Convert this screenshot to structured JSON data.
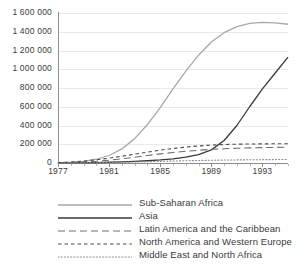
{
  "chart_data": {
    "type": "line",
    "title": "",
    "xlabel": "",
    "ylabel": "",
    "xlim": [
      1977,
      1995
    ],
    "ylim": [
      0,
      1600000
    ],
    "grid": true,
    "legend_position": "bottom",
    "x_ticks": [
      "1977",
      "1981",
      "1985",
      "1989",
      "1993"
    ],
    "x_tick_values": [
      1977,
      1981,
      1985,
      1989,
      1993
    ],
    "y_ticks": [
      "0",
      "200 000",
      "400 000",
      "600 000",
      "800 000",
      "1 000 000",
      "1 200 000",
      "1 400 000",
      "1 600 000"
    ],
    "y_tick_values": [
      0,
      200000,
      400000,
      600000,
      800000,
      1000000,
      1200000,
      1400000,
      1600000
    ],
    "x": [
      1977,
      1978,
      1979,
      1980,
      1981,
      1982,
      1983,
      1984,
      1985,
      1986,
      1987,
      1988,
      1989,
      1990,
      1991,
      1992,
      1993,
      1994,
      1995
    ],
    "series": [
      {
        "name": "Sub-Saharan Africa",
        "style": "solid",
        "color": "#a8a8a8",
        "values": [
          3000,
          8000,
          18000,
          40000,
          80000,
          150000,
          260000,
          410000,
          590000,
          790000,
          980000,
          1150000,
          1290000,
          1390000,
          1455000,
          1490000,
          1500000,
          1495000,
          1480000
        ]
      },
      {
        "name": "Asia",
        "style": "solid",
        "color": "#3a3a3a",
        "values": [
          1000,
          2000,
          3000,
          5000,
          8000,
          12000,
          17000,
          24000,
          33000,
          45000,
          62000,
          90000,
          140000,
          240000,
          400000,
          600000,
          790000,
          960000,
          1130000
        ]
      },
      {
        "name": "Latin America and the Caribbean",
        "style": "long-dash",
        "color": "#6e6e6e",
        "values": [
          2000,
          5000,
          10000,
          18000,
          30000,
          45000,
          62000,
          80000,
          97000,
          112000,
          125000,
          136000,
          145000,
          152000,
          157000,
          161000,
          164000,
          166000,
          168000
        ]
      },
      {
        "name": "North America and Western Europe",
        "style": "short-dash",
        "color": "#4a4a4a",
        "values": [
          4000,
          10000,
          20000,
          34000,
          52000,
          72000,
          94000,
          116000,
          137000,
          155000,
          170000,
          182000,
          191000,
          197000,
          201000,
          203000,
          204000,
          205000,
          206000
        ]
      },
      {
        "name": "Middle East and North Africa",
        "style": "dotted",
        "color": "#8a8a8a",
        "values": [
          500,
          1000,
          2000,
          3500,
          5500,
          8000,
          11000,
          14000,
          17500,
          21000,
          24000,
          27000,
          29500,
          31500,
          33000,
          34500,
          35500,
          36500,
          37500
        ]
      }
    ]
  }
}
